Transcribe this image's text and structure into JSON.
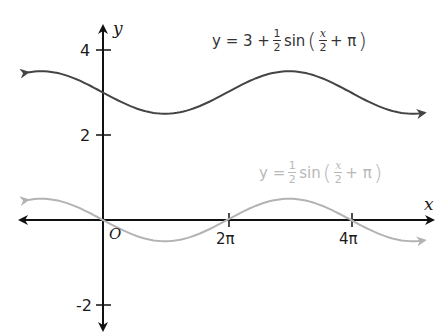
{
  "chart_data": {
    "type": "line",
    "title": "",
    "xlabel": "x",
    "ylabel": "y",
    "origin_label": "O",
    "x_ticks": [
      {
        "value": 6.2832,
        "label": "2π"
      },
      {
        "value": 12.5664,
        "label": "4π"
      }
    ],
    "y_ticks": [
      {
        "value": 4,
        "label": "4"
      },
      {
        "value": 2,
        "label": "2"
      },
      {
        "value": -2,
        "label": "-2"
      }
    ],
    "xlim": [
      -4.0,
      16.5
    ],
    "ylim": [
      -2.2,
      4.6
    ],
    "grid": false,
    "legend": "inline labels",
    "series": [
      {
        "name": "y = 3 + 1/2 sin(x/2 + π)",
        "color": "#444444",
        "function": "3 + 0.5*sin(x/2 + pi)",
        "x": [
          -3.8,
          0,
          3.1416,
          6.2832,
          9.4248,
          12.5664,
          16.3
        ],
        "values": [
          3.47,
          3.0,
          2.5,
          3.0,
          3.5,
          3.0,
          2.53
        ]
      },
      {
        "name": "y = 1/2 sin(x/2 + π)",
        "color": "#b3b3b3",
        "function": "0.5*sin(x/2 + pi)",
        "x": [
          -3.8,
          0,
          3.1416,
          6.2832,
          9.4248,
          12.5664,
          16.3
        ],
        "values": [
          0.47,
          0.0,
          -0.5,
          0.0,
          0.5,
          0.0,
          -0.47
        ]
      }
    ]
  },
  "labels": {
    "x_axis": "x",
    "y_axis": "y",
    "origin": "O",
    "tick_2pi": "2π",
    "tick_4pi": "4π",
    "tick_y4": "4",
    "tick_y2": "2",
    "tick_yneg2": "-2"
  },
  "equations": {
    "upper": {
      "lhs": "y = 3 +",
      "frac_num": "1",
      "frac_den": "2",
      "fn": "sin",
      "arg_num": "x",
      "arg_den": "2",
      "tail": "+ π"
    },
    "lower": {
      "lhs": "y =",
      "frac_num": "1",
      "frac_den": "2",
      "fn": "sin",
      "arg_num": "x",
      "arg_den": "2",
      "tail": "+ π"
    }
  }
}
